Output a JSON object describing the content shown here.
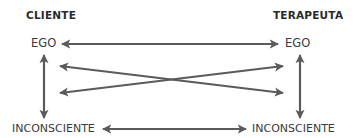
{
  "headings": {
    "left": "CLIENTE",
    "right": "TERAPEUTA"
  },
  "nodes": {
    "client_ego": "EGO",
    "therapist_ego": "EGO",
    "client_unconscious": "INCONSCIENTE",
    "therapist_unconscious": "INCONSCIENTE"
  },
  "connections": [
    {
      "from": "client_ego",
      "to": "therapist_ego",
      "direction": "bidirectional"
    },
    {
      "from": "client_ego",
      "to": "client_unconscious",
      "direction": "bidirectional"
    },
    {
      "from": "therapist_ego",
      "to": "therapist_unconscious",
      "direction": "bidirectional"
    },
    {
      "from": "client_unconscious",
      "to": "therapist_unconscious",
      "direction": "bidirectional"
    },
    {
      "from": "client_ego",
      "to": "therapist_unconscious",
      "direction": "bidirectional"
    },
    {
      "from": "client_unconscious",
      "to": "therapist_ego",
      "direction": "bidirectional"
    }
  ],
  "colors": {
    "arrow": "#5b5b5b",
    "text": "#2b2b2b"
  }
}
